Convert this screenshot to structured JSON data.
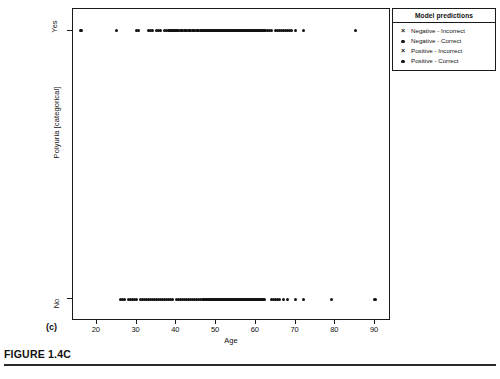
{
  "figure": {
    "caption": "FIGURE 1.4C",
    "panel_letter": "(c)"
  },
  "legend": {
    "title": "Model predictions",
    "position": "top-right-outside",
    "items": [
      {
        "marker": "cross",
        "label": "Negative - Incorrect"
      },
      {
        "marker": "dot",
        "label": "Negative - Correct"
      },
      {
        "marker": "cross",
        "label": "Positive - Incorrect"
      },
      {
        "marker": "dot",
        "label": "Positive - Correct"
      }
    ]
  },
  "chart_data": {
    "type": "scatter",
    "title": "",
    "xlabel": "Age",
    "ylabel": "Polyuria [categorical]",
    "xlim": [
      14,
      94
    ],
    "xticks": [
      20,
      30,
      40,
      50,
      60,
      70,
      80,
      90
    ],
    "xticklabels": [
      "20",
      "30",
      "40",
      "50",
      "60",
      "70",
      "80",
      "90"
    ],
    "ylim": [
      -0.08,
      1.08
    ],
    "yticks": [
      0,
      1
    ],
    "yticklabels": [
      "No",
      "Yes"
    ],
    "grid": false,
    "marker_color": "#111111",
    "series": [
      {
        "name": "Polyuria = Yes",
        "y": 1,
        "x": [
          16,
          25,
          30,
          30.4,
          33,
          33.5,
          34,
          35,
          35.5,
          36,
          37,
          37.5,
          38,
          38.4,
          38.8,
          39,
          39.4,
          39.8,
          40,
          40.3,
          40.6,
          41,
          41.3,
          41.6,
          42,
          42.3,
          42.6,
          43,
          43.3,
          43.6,
          44,
          44.3,
          44.6,
          45,
          45.3,
          45.6,
          46,
          46.3,
          46.6,
          47,
          47.3,
          47.6,
          48,
          48.3,
          48.6,
          49,
          49.3,
          49.6,
          50,
          50.3,
          50.6,
          51,
          51.3,
          51.6,
          52,
          52.3,
          52.6,
          53,
          53.3,
          53.6,
          54,
          54.4,
          54.8,
          55,
          55.4,
          55.8,
          56,
          56.5,
          57,
          57.5,
          58,
          58.5,
          59,
          59.5,
          60,
          60.5,
          61,
          61.5,
          62,
          62.5,
          63,
          63.5,
          64,
          65,
          65.5,
          66,
          66.5,
          67,
          67.5,
          68,
          68.5,
          69,
          70,
          72,
          85
        ]
      },
      {
        "name": "Polyuria = No",
        "y": 0,
        "x": [
          26,
          26.5,
          27,
          28,
          28.5,
          29,
          29.5,
          30,
          31,
          31.5,
          32,
          32.5,
          33,
          33.5,
          34,
          34.5,
          35,
          35.5,
          36,
          36.5,
          37,
          37.5,
          38,
          38.5,
          39,
          40,
          40.5,
          41,
          41.5,
          42,
          42.5,
          43,
          43.5,
          44,
          44.5,
          45,
          45.5,
          46,
          46.5,
          47,
          47.5,
          48,
          48.5,
          49,
          49.5,
          50,
          50.5,
          51,
          51.5,
          52,
          52.5,
          53,
          53.5,
          54,
          54.5,
          55,
          55.5,
          56,
          56.5,
          57,
          57.5,
          58,
          58.5,
          59,
          59.5,
          60,
          60.5,
          61,
          61.5,
          62,
          64,
          64.5,
          65,
          65.5,
          66,
          67,
          68,
          70,
          72,
          79,
          90
        ]
      }
    ]
  }
}
